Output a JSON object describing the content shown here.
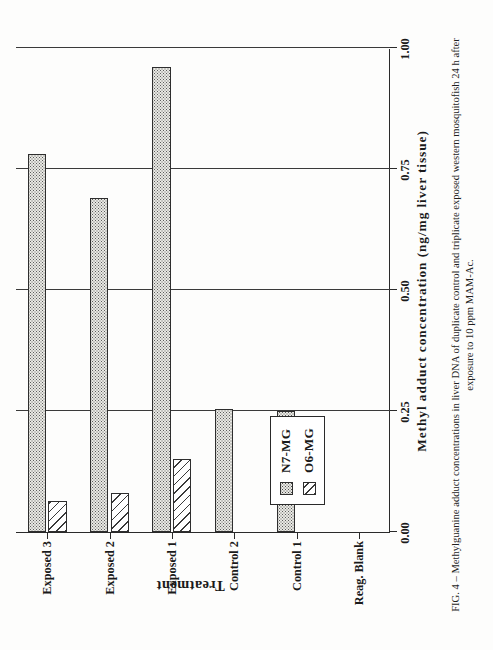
{
  "figure": {
    "caption": "FIG. 4 – Methylguanine adduct concentrations in liver DNA of duplicate control and triplicate exposed western mosquitofish 24 h after exposure to 10 ppm MAM-Ac."
  },
  "legend": {
    "position": "inside-plot-lower-left",
    "entries": [
      {
        "label": "N7-MG",
        "pattern": "stipple-dot",
        "swatch_name": "legend-swatch-n7mg"
      },
      {
        "label": "O6-MG",
        "pattern": "diagonal-hatch",
        "swatch_name": "legend-swatch-o6mg"
      }
    ]
  },
  "chart_data": {
    "type": "bar",
    "orientation": "horizontal-rotated-page",
    "title": "",
    "xlabel": "Treatment",
    "ylabel": "Methyl adduct concentration  (ng/mg liver tissue)",
    "categories": [
      "Reag. Blank",
      "Control 1",
      "Control 2",
      "Exposed 1",
      "Exposed 2",
      "Exposed 3"
    ],
    "series": [
      {
        "name": "N7-MG",
        "values": [
          0.0,
          0.25,
          0.255,
          0.96,
          0.69,
          0.78
        ]
      },
      {
        "name": "O6-MG",
        "values": [
          0.0,
          0.0,
          0.0,
          0.15,
          0.08,
          0.065
        ]
      }
    ],
    "ylim": [
      0.0,
      1.0
    ],
    "yticks": [
      0.0,
      0.25,
      0.5,
      0.75,
      1.0
    ],
    "ytick_labels": [
      "0.00",
      "0.25",
      "0.50",
      "0.75",
      "1.00"
    ],
    "grid": true,
    "grid_axis": "value",
    "legend_entries": [
      "N7-MG",
      "O6-MG"
    ]
  }
}
